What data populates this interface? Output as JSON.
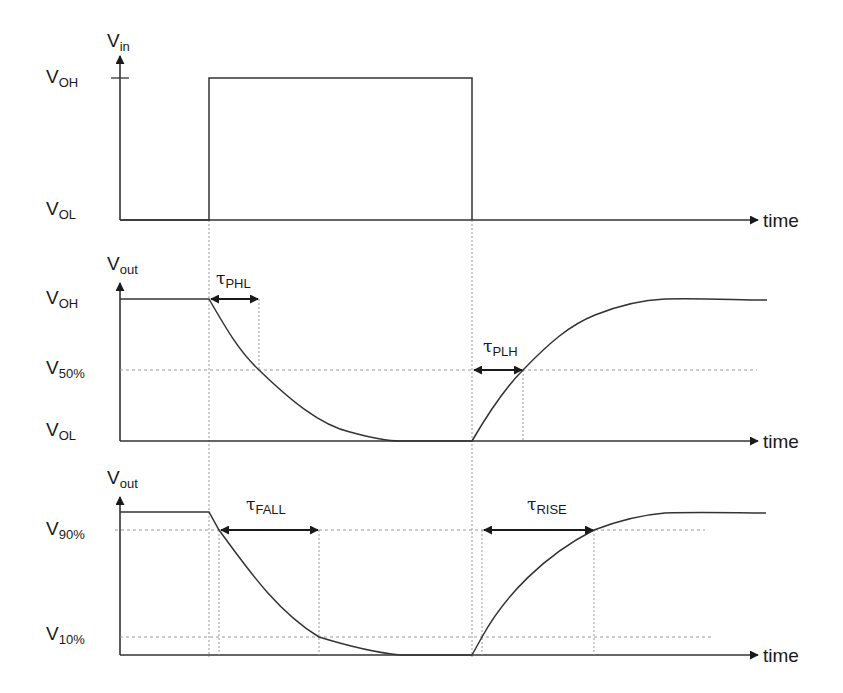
{
  "diagram": {
    "colors": {
      "line": "#333333",
      "dotted": "#999999",
      "text": "#1a1a1a",
      "background": "#ffffff"
    },
    "panels": [
      {
        "id": "input",
        "y_axis_label": {
          "main": "V",
          "sub": "in"
        },
        "levels": [
          {
            "main": "V",
            "sub": "OH"
          },
          {
            "main": "V",
            "sub": "OL"
          }
        ],
        "x_axis_label": "time"
      },
      {
        "id": "output-delay",
        "y_axis_label": {
          "main": "V",
          "sub": "out"
        },
        "levels": [
          {
            "main": "V",
            "sub": "OH"
          },
          {
            "main": "V",
            "sub": "50%"
          },
          {
            "main": "V",
            "sub": "OL"
          }
        ],
        "x_axis_label": "time",
        "annotations": [
          {
            "symbol": "τ",
            "sub": "PHL"
          },
          {
            "symbol": "τ",
            "sub": "PLH"
          }
        ]
      },
      {
        "id": "output-transition",
        "y_axis_label": {
          "main": "V",
          "sub": "out"
        },
        "levels": [
          {
            "main": "V",
            "sub": "90%"
          },
          {
            "main": "V",
            "sub": "10%"
          }
        ],
        "x_axis_label": "time",
        "annotations": [
          {
            "symbol": "τ",
            "sub": "FALL"
          },
          {
            "symbol": "τ",
            "sub": "RISE"
          }
        ]
      }
    ]
  }
}
